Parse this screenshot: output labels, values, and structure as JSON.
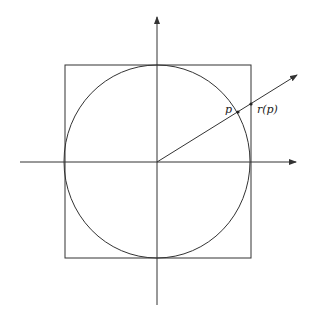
{
  "diagram": {
    "type": "geometry",
    "labels": {
      "p": "p",
      "rp": "r(p)"
    },
    "colors": {
      "stroke": "#333333",
      "background": "#ffffff"
    },
    "elements": [
      "x-axis",
      "y-axis",
      "square",
      "inscribed-circle",
      "ray-from-origin",
      "point-p",
      "point-r-of-p"
    ]
  }
}
